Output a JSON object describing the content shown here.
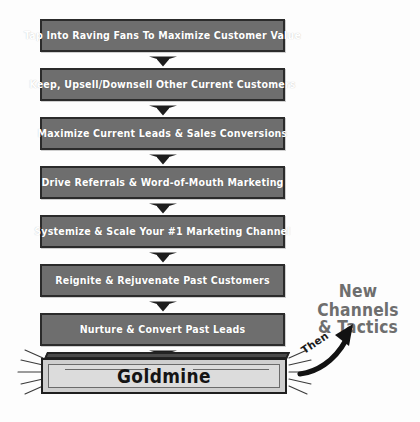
{
  "diagram": {
    "colors": {
      "box_fill": "#6e6e6e",
      "box_border": "#2b2b2b",
      "box_text": "#ffffff",
      "goldmine_fill": "#cfcfcf",
      "goldmine_inner": "#dcdcdc",
      "goldmine_top": "#4a4a4a",
      "annotation_text": "#6e6e6e",
      "arrow": "#1a1a1a",
      "background": "#fdfdfd"
    },
    "steps": [
      {
        "label": "Tap Into Raving Fans To Maximize Customer Value"
      },
      {
        "label": "Keep, Upsell/Downsell Other Current Customers"
      },
      {
        "label": "Maximize Current Leads & Sales Conversions"
      },
      {
        "label": "Drive Referrals & Word-of-Mouth Marketing"
      },
      {
        "label": "Systemize & Scale Your #1 Marketing Channel"
      },
      {
        "label": "Reignite & Rejuvenate Past Customers"
      },
      {
        "label": "Nurture & Convert Past Leads"
      }
    ],
    "result": {
      "label": "Goldmine"
    },
    "annotation": {
      "connector_label": "Then",
      "line1": "New Channels",
      "line2": "& Tactics"
    },
    "icons": {
      "down_arrow": "down-arrow-icon",
      "curved_arrow": "curved-up-arrow-icon",
      "sparkle": "sparkle-rays-icon"
    }
  }
}
